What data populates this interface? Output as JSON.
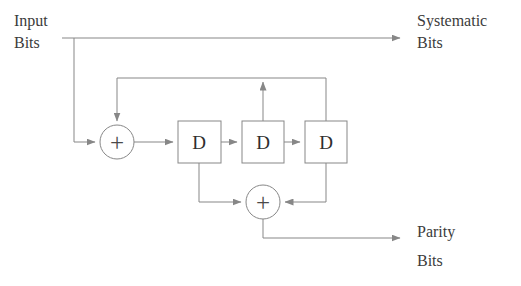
{
  "figure": {
    "type": "block-diagram",
    "name": "recursive-systematic-convolutional-encoder",
    "width": 521,
    "height": 286,
    "background_color": "#ffffff",
    "line_color": "#808080",
    "text_color": "#3b3b3b"
  },
  "labels": {
    "input_line1": "Input",
    "input_line2": "Bits",
    "systematic_line1": "Systematic",
    "systematic_line2": "Bits",
    "parity_line1": "Parity",
    "parity_line2": "Bits"
  },
  "blocks": [
    {
      "id": "d1",
      "label": "D",
      "x": 178,
      "y": 121,
      "w": 43,
      "h": 42
    },
    {
      "id": "d2",
      "label": "D",
      "x": 242,
      "y": 121,
      "w": 42,
      "h": 42
    },
    {
      "id": "d3",
      "label": "D",
      "x": 305,
      "y": 121,
      "w": 42,
      "h": 42
    }
  ],
  "adders": [
    {
      "id": "adder-top",
      "label": "+",
      "cx": 117,
      "cy": 142,
      "r": 17
    },
    {
      "id": "adder-bottom",
      "label": "+",
      "cx": 263,
      "cy": 202,
      "r": 17
    }
  ],
  "signals": {
    "input_tap_x": 74,
    "systematic_line_y": 38,
    "feedback_line_y": 78,
    "parity_line_y": 238,
    "arrow_end_x": 405
  }
}
